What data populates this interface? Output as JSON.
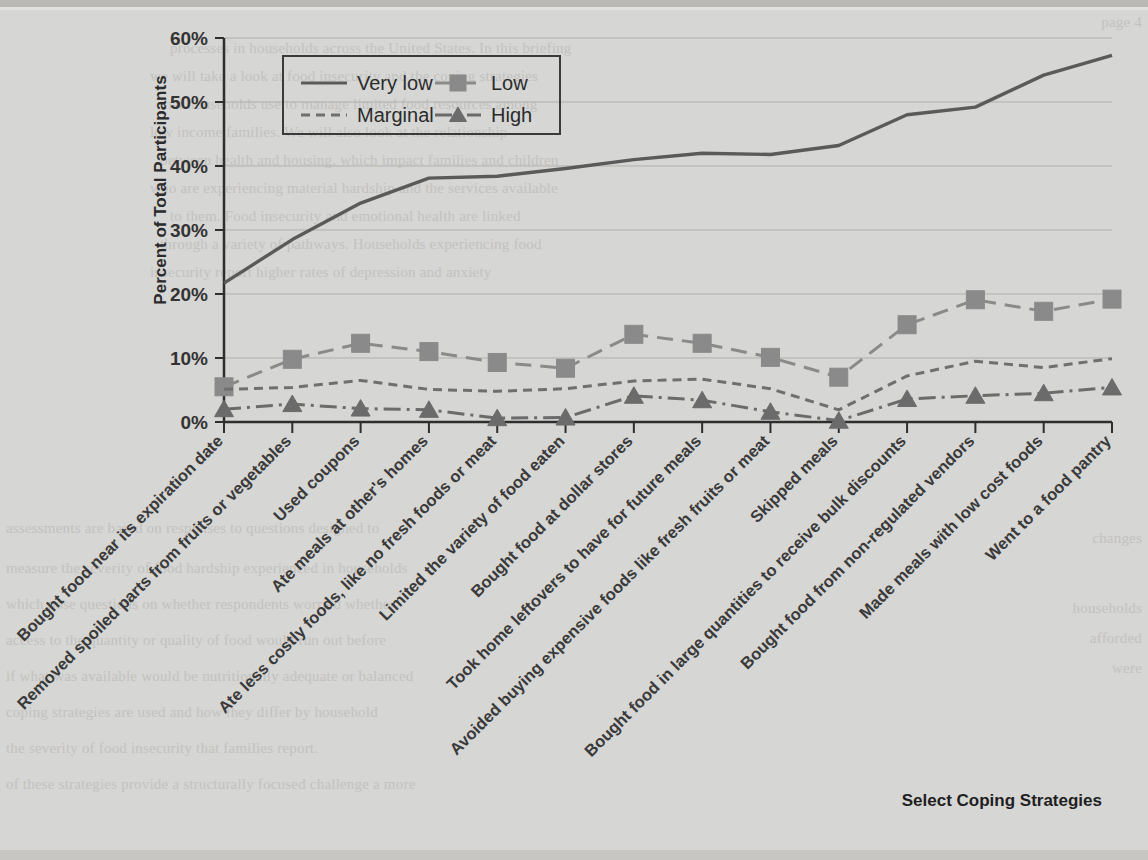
{
  "chart_data": {
    "type": "line",
    "title": "",
    "xlabel": "Select Coping Strategies",
    "ylabel": "Percent of Total Participants",
    "ylim": [
      0,
      60
    ],
    "ytick_labels": [
      "0%",
      "10%",
      "20%",
      "30%",
      "40%",
      "50%",
      "60%"
    ],
    "ytick_values": [
      0,
      10,
      20,
      30,
      40,
      50,
      60
    ],
    "grid": true,
    "legend_position": "top-left-inside",
    "categories": [
      "Bought food near its expiration date",
      "Removed spoiled parts from fruits or vegetables",
      "Used coupons",
      "Ate meals at other's homes",
      "Ate less costly foods, like no fresh foods or meat",
      "Limited the variety of food eaten",
      "Bought food at dollar stores",
      "Took home leftovers to have for future meals",
      "Avoided buying expensive foods like fresh fruits or meat",
      "Skipped meals",
      "Bought food in large quantities to receive bulk discounts",
      "Bought food from non-regulated vendors",
      "Made meals with low cost foods",
      "Went to a food pantry"
    ],
    "series": [
      {
        "name": "Very low",
        "style": "solid",
        "marker": "none",
        "color": "#5a5a5a",
        "values": [
          21.7,
          28.5,
          34.2,
          38.1,
          38.4,
          39.6,
          41.0,
          42.0,
          41.8,
          43.2,
          48.0,
          49.2,
          54.2,
          57.3
        ]
      },
      {
        "name": "Low",
        "style": "dashed",
        "marker": "square",
        "color": "#8a8a8a",
        "values": [
          5.5,
          9.8,
          12.3,
          11.0,
          9.3,
          8.4,
          13.7,
          12.3,
          10.1,
          7.0,
          15.2,
          19.1,
          17.3,
          19.2
        ]
      },
      {
        "name": "Marginal",
        "style": "dotted-dash",
        "marker": "none",
        "color": "#6f6f6f",
        "values": [
          5.1,
          5.4,
          6.5,
          5.1,
          4.8,
          5.2,
          6.4,
          6.7,
          5.2,
          1.9,
          7.2,
          9.5,
          8.5,
          9.9
        ]
      },
      {
        "name": "High",
        "style": "dash-dot",
        "marker": "triangle",
        "color": "#6b6b6b",
        "values": [
          2.0,
          2.8,
          2.1,
          1.9,
          0.6,
          0.7,
          4.1,
          3.4,
          1.6,
          0.2,
          3.6,
          4.1,
          4.5,
          5.4
        ]
      }
    ]
  },
  "legend": {
    "items": [
      {
        "label": "Very low"
      },
      {
        "label": "Low"
      },
      {
        "label": "Marginal"
      },
      {
        "label": "High"
      }
    ]
  },
  "background_text": {
    "lines": [
      {
        "x": 170,
        "y": 40,
        "text": "processes in households across the United States. In this briefing"
      },
      {
        "x": 150,
        "y": 68,
        "text": "we will take a look at food insecurity and the coping strategies"
      },
      {
        "x": 160,
        "y": 96,
        "text": "that households use to manage limited food resources among"
      },
      {
        "x": 150,
        "y": 124,
        "text": "low income families. We will also look at the relationship"
      },
      {
        "x": 160,
        "y": 152,
        "text": "between health and housing, which impact families and children"
      },
      {
        "x": 150,
        "y": 180,
        "text": "who are experiencing material hardship and the services available"
      },
      {
        "x": 170,
        "y": 208,
        "text": "to them. Food insecurity and emotional health are linked"
      },
      {
        "x": 160,
        "y": 236,
        "text": "through a variety of pathways. Households experiencing food"
      },
      {
        "x": 150,
        "y": 264,
        "text": "insecurity report higher rates of depression and anxiety"
      }
    ],
    "left_lines": [
      {
        "x": 10,
        "y": 38,
        "text": ""
      },
      {
        "x": 6,
        "y": 530,
        "text": "measures"
      },
      {
        "x": 6,
        "y": 600,
        "text": "which pose"
      },
      {
        "x": 6,
        "y": 630,
        "text": "households"
      },
      {
        "x": 6,
        "y": 660,
        "text": "want"
      },
      {
        "x": 6,
        "y": 690,
        "text": "were"
      },
      {
        "x": 6,
        "y": 760,
        "text": "father"
      }
    ],
    "right_lines": [
      {
        "x": 1142,
        "y": 14,
        "text": "page 4"
      },
      {
        "x": 1142,
        "y": 530,
        "text": "changes"
      },
      {
        "x": 1142,
        "y": 600,
        "text": "households"
      },
      {
        "x": 1142,
        "y": 630,
        "text": "afforded"
      },
      {
        "x": 1142,
        "y": 660,
        "text": "were"
      }
    ],
    "bottom_lines": [
      {
        "x": 6,
        "y": 520,
        "text": "assessments are based on responses to questions designed to"
      },
      {
        "x": 6,
        "y": 560,
        "text": "measure the severity of food hardship experienced in households"
      },
      {
        "x": 6,
        "y": 596,
        "text": "which pose questions on whether respondents worried whether"
      },
      {
        "x": 6,
        "y": 632,
        "text": "access to the quantity or quality of food would run out before"
      },
      {
        "x": 6,
        "y": 668,
        "text": "if what was available would be nutritionally adequate or balanced"
      },
      {
        "x": 6,
        "y": 704,
        "text": "coping strategies are used and how they differ by household"
      },
      {
        "x": 6,
        "y": 740,
        "text": "the severity of food insecurity that families report."
      },
      {
        "x": 6,
        "y": 776,
        "text": "of these strategies provide a structurally focused challenge a more"
      }
    ]
  }
}
